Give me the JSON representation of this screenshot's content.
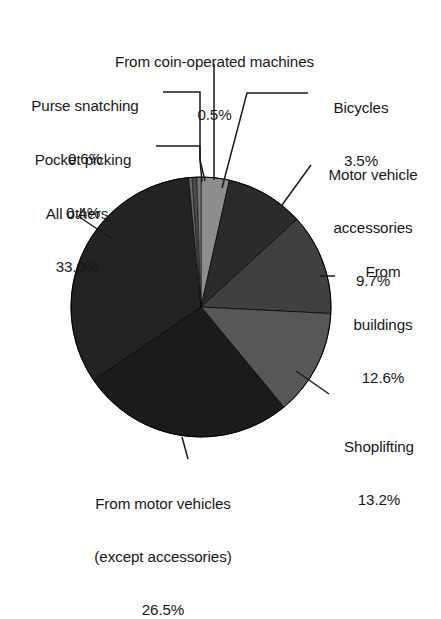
{
  "chart_data": {
    "type": "pie",
    "title": "",
    "subtitle": "",
    "xlabel": "",
    "ylabel": "",
    "legend_position": "labels-with-leader-lines",
    "grid": false,
    "value_unit": "percent",
    "categories": [
      "Bicycles",
      "Motor vehicle accessories",
      "From buildings",
      "Shoplifting",
      "From motor vehicles (except accessories)",
      "All others",
      "Pocket picking",
      "Purse snatching",
      "From coin-operated machines"
    ],
    "values": [
      3.5,
      9.7,
      12.6,
      13.2,
      26.5,
      33.0,
      0.4,
      0.6,
      0.5
    ],
    "slice_colors": [
      "#8d8d8d",
      "#2b2b2b",
      "#3f4042",
      "#565758",
      "#1b1b1c",
      "#232324",
      "#6a6b6c",
      "#4a4a4b",
      "#767676"
    ],
    "slices": [
      {
        "label": "Bicycles",
        "value": 3.5,
        "display": "3.5%"
      },
      {
        "label": "Motor vehicle accessories",
        "value": 9.7,
        "display": "9.7%"
      },
      {
        "label": "From buildings",
        "value": 12.6,
        "display": "12.6%"
      },
      {
        "label": "Shoplifting",
        "value": 13.2,
        "display": "13.2%"
      },
      {
        "label": "From motor vehicles (except accessories)",
        "value": 26.5,
        "display": "26.5%"
      },
      {
        "label": "All others",
        "value": 33.0,
        "display": "33.0%"
      },
      {
        "label": "Pocket picking",
        "value": 0.4,
        "display": "0.4%"
      },
      {
        "label": "Purse snatching",
        "value": 0.6,
        "display": "0.6%"
      },
      {
        "label": "From coin-operated machines",
        "value": 0.5,
        "display": "0.5%"
      }
    ]
  },
  "labels": {
    "coin_operated": {
      "name": "From coin-operated machines",
      "value": "0.5%"
    },
    "purse_snatching": {
      "name": "Purse snatching",
      "value": "0.6%"
    },
    "pocket_picking": {
      "name": "Pocket picking",
      "value": "0.4%"
    },
    "all_others": {
      "name": "All others",
      "value": "33.0%"
    },
    "bicycles": {
      "name": "Bicycles",
      "value": "3.5%"
    },
    "motor_vehicle_accessories": {
      "name_line1": "Motor vehicle",
      "name_line2": "accessories",
      "value": "9.7%"
    },
    "from_buildings": {
      "name_line1": "From",
      "name_line2": "buildings",
      "value": "12.6%"
    },
    "shoplifting": {
      "name": "Shoplifting",
      "value": "13.2%"
    },
    "from_motor_vehicles": {
      "name_line1": "From motor vehicles",
      "name_line2": "(except accessories)",
      "value": "26.5%"
    }
  }
}
